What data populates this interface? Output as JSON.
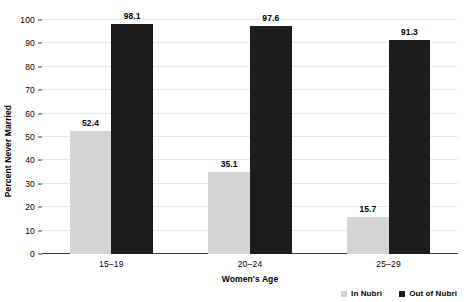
{
  "chart_data": {
    "type": "bar",
    "title": "",
    "xlabel": "Women's Age",
    "ylabel": "Percent Never Married",
    "categories": [
      "15–19",
      "20–24",
      "25–29"
    ],
    "series": [
      {
        "name": "In Nubri",
        "color": "#d5d5d5",
        "values": [
          52.4,
          35.1,
          15.7
        ]
      },
      {
        "name": "Out of Nubri",
        "color": "#1c1c1c",
        "values": [
          98.1,
          97.6,
          91.3
        ]
      }
    ],
    "value_labels": [
      [
        "52.4",
        "35.1",
        "15.7"
      ],
      [
        "98.1",
        "97.6",
        "91.3"
      ]
    ],
    "ylim": [
      0,
      100
    ],
    "yticks": [
      0,
      10,
      20,
      30,
      40,
      50,
      60,
      70,
      80,
      90,
      100
    ],
    "ytick_labels": [
      "0",
      "10",
      "20",
      "30",
      "40",
      "50",
      "60",
      "70",
      "80",
      "90",
      "100"
    ],
    "grid": true,
    "legend_position": "bottom-right",
    "background": "#ffffff"
  }
}
